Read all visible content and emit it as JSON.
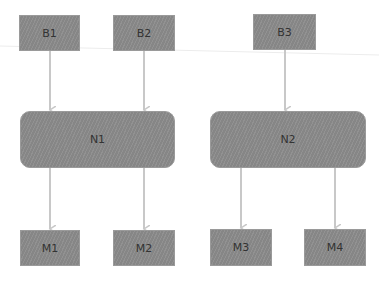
{
  "diagram": {
    "colors": {
      "node_fill": "#8b8b8b",
      "arrow": "#c8c8c8",
      "background": "#ffffff"
    },
    "nodes": [
      {
        "id": "B1",
        "label": "B1",
        "shape": "rect",
        "x": 19,
        "y": 15,
        "w": 61,
        "h": 36
      },
      {
        "id": "B2",
        "label": "B2",
        "shape": "rect",
        "x": 113,
        "y": 15,
        "w": 62,
        "h": 36
      },
      {
        "id": "B3",
        "label": "B3",
        "shape": "rect",
        "x": 253,
        "y": 14,
        "w": 63,
        "h": 36
      },
      {
        "id": "N1",
        "label": "N1",
        "shape": "rounded",
        "x": 20,
        "y": 111,
        "w": 155,
        "h": 57
      },
      {
        "id": "N2",
        "label": "N2",
        "shape": "rounded",
        "x": 210,
        "y": 111,
        "w": 156,
        "h": 57
      },
      {
        "id": "M1",
        "label": "M1",
        "shape": "rect",
        "x": 20,
        "y": 230,
        "w": 60,
        "h": 36
      },
      {
        "id": "M2",
        "label": "M2",
        "shape": "rect",
        "x": 113,
        "y": 230,
        "w": 62,
        "h": 36
      },
      {
        "id": "M3",
        "label": "M3",
        "shape": "rect",
        "x": 210,
        "y": 229,
        "w": 62,
        "h": 37
      },
      {
        "id": "M4",
        "label": "M4",
        "shape": "rect",
        "x": 304,
        "y": 229,
        "w": 62,
        "h": 37
      }
    ],
    "edges": [
      {
        "from": "B1",
        "to": "N1"
      },
      {
        "from": "B2",
        "to": "N1"
      },
      {
        "from": "B3",
        "to": "N2"
      },
      {
        "from": "N1",
        "to": "M1"
      },
      {
        "from": "N1",
        "to": "M2"
      },
      {
        "from": "N2",
        "to": "M3"
      },
      {
        "from": "N2",
        "to": "M4"
      }
    ]
  }
}
